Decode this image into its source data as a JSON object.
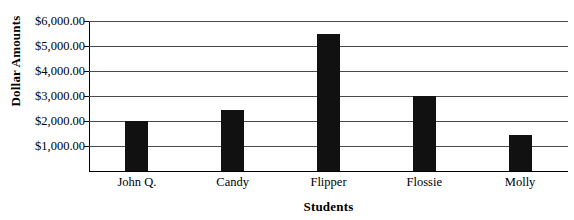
{
  "chart_data": {
    "type": "bar",
    "title": "",
    "categories": [
      "John Q.",
      "Candy",
      "Flipper",
      "Flossie",
      "Molly"
    ],
    "values": [
      2000,
      2450,
      5500,
      3000,
      1450
    ],
    "xlabel": "Students",
    "ylabel": "Dollar Amounts",
    "ylim": [
      0,
      6000
    ],
    "ytick_values": [
      1000,
      2000,
      3000,
      4000,
      5000,
      6000
    ],
    "ytick_labels": [
      "$1,000.00",
      "$2,000.00",
      "$3,000.00",
      "$4,000.00",
      "$5,000.00",
      "$6,000.00"
    ],
    "grid": true,
    "legend": false,
    "bar_color": "#111111",
    "gridline_color": "#4a4a4a",
    "axis_color": "#000000",
    "background_color": "#ffffff"
  },
  "cutoff_title": ""
}
